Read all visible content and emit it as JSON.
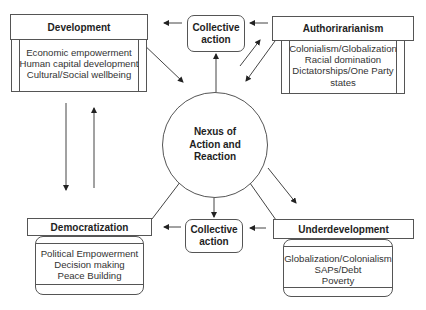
{
  "diagram": {
    "center": {
      "label_lines": [
        "Nexus of",
        "Action and",
        "Reaction"
      ]
    },
    "collective_top": {
      "label_lines": [
        "Collective",
        "action"
      ]
    },
    "collective_bottom": {
      "label_lines": [
        "Collective",
        "action"
      ]
    },
    "development": {
      "title": "Development",
      "items": [
        "Economic empowerment",
        "Human capital development",
        "Cultural/Social wellbeing"
      ]
    },
    "authoritarianism": {
      "title": "Authorirarianism",
      "items": [
        "Colonialism/Globalization",
        "Racial domination",
        "Dictatorships/One Party",
        "states"
      ]
    },
    "democratization": {
      "title": "Democratization",
      "items": [
        "Political Empowerment",
        "Decision making",
        "Peace Building"
      ]
    },
    "underdevelopment": {
      "title": "Underdevelopment",
      "items": [
        "Globalization/Colonialism",
        "SAPs/Debt",
        "Poverty"
      ]
    },
    "colors": {
      "line": "#555555",
      "text": "#1e1e1e",
      "background": "#ffffff"
    }
  }
}
